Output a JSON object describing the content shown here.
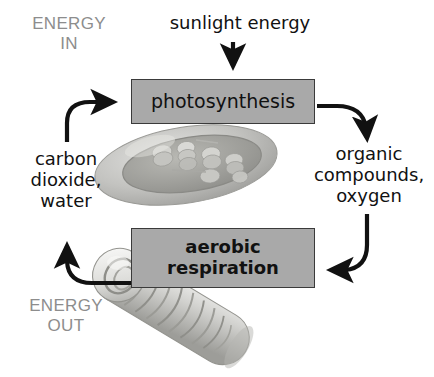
{
  "diagram": {
    "type": "cycle-diagram",
    "colors": {
      "box_fill": "#a9a9a9",
      "box_border": "#3a3a3a",
      "arrow": "#111111",
      "energy_label": "#8d8d8d",
      "main_text": "#111111",
      "background": "#ffffff"
    },
    "processes": [
      {
        "id": "photosynthesis",
        "label": "photosynthesis",
        "organelle": "chloroplast"
      },
      {
        "id": "aerobic-respiration",
        "label_line1": "aerobic",
        "label_line2": "respiration",
        "organelle": "mitochondrion"
      }
    ],
    "labels": {
      "energy_in": "ENERGY\nIN",
      "energy_out": "ENERGY\nOUT",
      "sunlight": "sunlight energy",
      "inputs": "carbon\ndioxide,\nwater",
      "outputs": "organic\ncompounds,\noxygen"
    },
    "arrows": [
      {
        "id": "sunlight-into-photosynthesis",
        "from": "sunlight energy",
        "to": "photosynthesis",
        "shape": "straight-down"
      },
      {
        "id": "photosynthesis-to-outputs",
        "from": "photosynthesis",
        "to": "organic compounds, oxygen",
        "shape": "curve-right-down"
      },
      {
        "id": "outputs-to-respiration",
        "from": "organic compounds, oxygen",
        "to": "aerobic respiration",
        "shape": "curve-down-left"
      },
      {
        "id": "respiration-to-inputs",
        "from": "aerobic respiration",
        "to": "carbon dioxide, water",
        "shape": "curve-left-up"
      },
      {
        "id": "inputs-to-photosynthesis",
        "from": "carbon dioxide, water",
        "to": "photosynthesis",
        "shape": "curve-up-right"
      }
    ]
  }
}
